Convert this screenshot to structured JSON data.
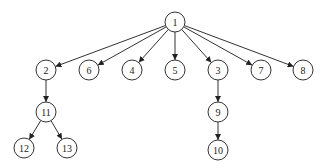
{
  "diagram": {
    "type": "tree",
    "node_radius": 10,
    "colors": {
      "stroke": "#333333",
      "fill": "#ffffff",
      "text": "#222222"
    },
    "nodes": [
      {
        "id": "1",
        "label": "1",
        "x": 175,
        "y": 22
      },
      {
        "id": "2",
        "label": "2",
        "x": 46,
        "y": 70
      },
      {
        "id": "6",
        "label": "6",
        "x": 89,
        "y": 70
      },
      {
        "id": "4",
        "label": "4",
        "x": 132,
        "y": 70
      },
      {
        "id": "5",
        "label": "5",
        "x": 175,
        "y": 70
      },
      {
        "id": "3",
        "label": "3",
        "x": 218,
        "y": 70
      },
      {
        "id": "7",
        "label": "7",
        "x": 261,
        "y": 70
      },
      {
        "id": "8",
        "label": "8",
        "x": 303,
        "y": 70
      },
      {
        "id": "11",
        "label": "11",
        "x": 46,
        "y": 112
      },
      {
        "id": "9",
        "label": "9",
        "x": 218,
        "y": 112
      },
      {
        "id": "12",
        "label": "12",
        "x": 24,
        "y": 148
      },
      {
        "id": "13",
        "label": "13",
        "x": 67,
        "y": 148
      },
      {
        "id": "10",
        "label": "10",
        "x": 218,
        "y": 150
      }
    ],
    "edges": [
      {
        "from": "1",
        "to": "2"
      },
      {
        "from": "1",
        "to": "6"
      },
      {
        "from": "1",
        "to": "4"
      },
      {
        "from": "1",
        "to": "5"
      },
      {
        "from": "1",
        "to": "3"
      },
      {
        "from": "1",
        "to": "7"
      },
      {
        "from": "1",
        "to": "8"
      },
      {
        "from": "2",
        "to": "11"
      },
      {
        "from": "11",
        "to": "12"
      },
      {
        "from": "11",
        "to": "13"
      },
      {
        "from": "3",
        "to": "9"
      },
      {
        "from": "9",
        "to": "10"
      }
    ]
  }
}
